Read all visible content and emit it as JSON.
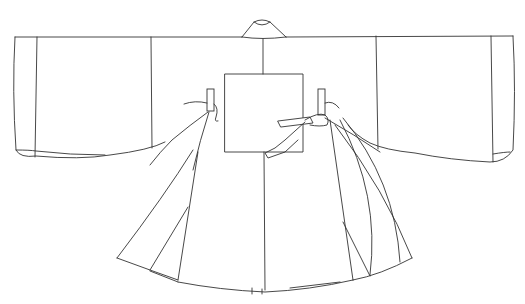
{
  "figure": {
    "stroke_color": "#333333",
    "background": "#ffffff",
    "parts": [
      "collar",
      "left-sleeve",
      "right-sleeve",
      "chest-patch",
      "left-tie",
      "right-tie",
      "left-side-panels",
      "right-side-panels",
      "body-front"
    ]
  }
}
